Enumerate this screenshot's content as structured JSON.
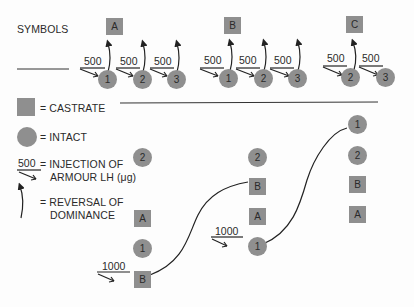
{
  "legend": {
    "title": "SYMBOLS",
    "castrate": "= CASTRATE",
    "intact": "= INTACT",
    "injection_dose": "500",
    "injection_line1": "= INJECTION OF",
    "injection_line2": "ARMOUR LH (μg)",
    "reversal_line1": "= REVERSAL OF",
    "reversal_line2": "DOMINANCE"
  },
  "top_sequences": [
    {
      "castrate": "A",
      "injections": [
        {
          "dose": "500",
          "animal": "1"
        },
        {
          "dose": "500",
          "animal": "2"
        },
        {
          "dose": "500",
          "animal": "3"
        }
      ]
    },
    {
      "castrate": "B",
      "injections": [
        {
          "dose": "500",
          "animal": "1"
        },
        {
          "dose": "500",
          "animal": "2"
        },
        {
          "dose": "500",
          "animal": "3"
        }
      ]
    },
    {
      "castrate": "C",
      "injections": [
        {
          "dose": "500",
          "animal": "2"
        },
        {
          "dose": "500",
          "animal": "3"
        }
      ]
    }
  ],
  "hierarchies": [
    {
      "order_top_to_bottom": [
        "2",
        "A",
        "1",
        "B"
      ],
      "injection": {
        "dose": "1000",
        "target": "B"
      }
    },
    {
      "order_top_to_bottom": [
        "2",
        "B",
        "A",
        "1"
      ],
      "injection": {
        "dose": "1000",
        "target": "1"
      }
    },
    {
      "order_top_to_bottom": [
        "1",
        "2",
        "B",
        "A"
      ]
    }
  ],
  "colors": {
    "symbol_fill": "#8f8f8f",
    "line": "#222222",
    "text": "#2a2a2a"
  }
}
